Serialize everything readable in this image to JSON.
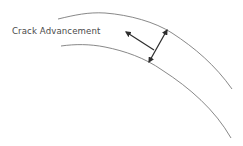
{
  "diagram": {
    "label": "Crack Advancement",
    "colors": {
      "background": "#ffffff",
      "curve": "#7a7a7a",
      "arrow": "#2e2e2e",
      "text": "#4a4a4a"
    },
    "elements": [
      {
        "type": "curve",
        "name": "upper-crack-boundary"
      },
      {
        "type": "curve",
        "name": "lower-crack-boundary"
      },
      {
        "type": "arrow",
        "name": "crack-advancement-arrow",
        "direction": "up-left"
      },
      {
        "type": "double-arrow",
        "name": "crack-width-arrow",
        "direction": "between boundaries"
      }
    ]
  }
}
